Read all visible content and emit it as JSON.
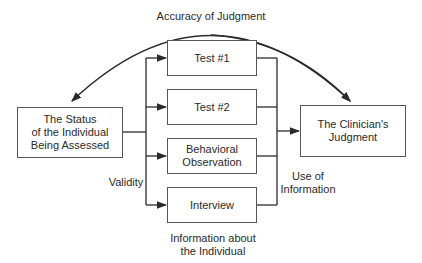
{
  "diagram": {
    "title_arc_label": "Accuracy of Judgment",
    "source_box": "The Status\nof the Individual\nBeing Assessed",
    "target_box": "The Clinician's\nJudgment",
    "methods": [
      {
        "label": "Test #1"
      },
      {
        "label": "Test #2"
      },
      {
        "label": "Behavioral\nObservation"
      },
      {
        "label": "Interview"
      }
    ],
    "validity_label": "Validity",
    "use_label": "Use of\nInformation",
    "info_label": "Information about\nthe Individual",
    "colors": {
      "line": "#2a2a2a",
      "box_border": "#555555",
      "text": "#2a2a2a"
    }
  }
}
